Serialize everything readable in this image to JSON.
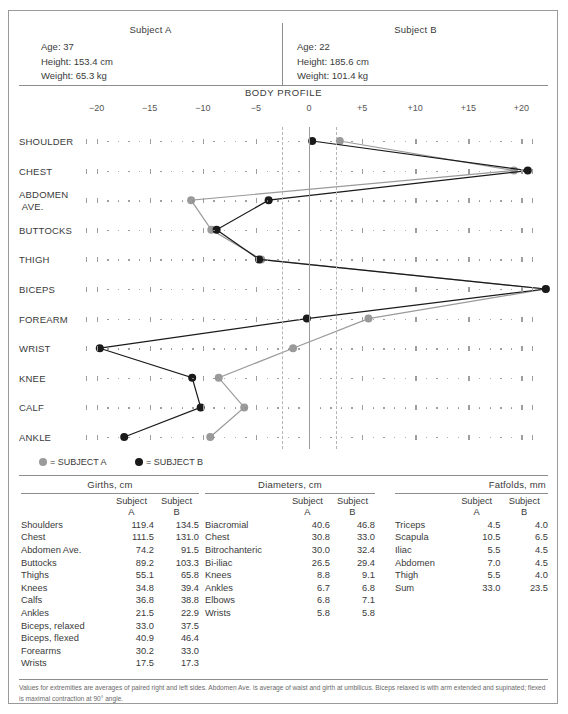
{
  "subjects": {
    "a": {
      "title": "Subject A",
      "age": "Age:  37",
      "height": "Height:  153.4 cm",
      "weight": "Weight:  65.3 kg"
    },
    "b": {
      "title": "Subject B",
      "age": "Age:  22",
      "height": "Height:  185.6 cm",
      "weight": "Weight:  101.4 kg"
    }
  },
  "chart_title": "BODY  PROFILE",
  "legend": {
    "a": "= SUBJECT A",
    "b": "= SUBJECT B",
    "color_a": "#9a9a9a",
    "color_b": "#1a1a1a"
  },
  "chart_data": {
    "type": "line",
    "title": "BODY PROFILE",
    "xlabel": "",
    "ylabel": "",
    "xlim": [
      -20,
      20
    ],
    "grid": true,
    "legend_position": "below",
    "orientation": "horizontal",
    "xticks": [
      "−20",
      "−15",
      "−10",
      "−5",
      "0",
      "+5",
      "+10",
      "+15",
      "+20"
    ],
    "xtick_values": [
      -20,
      -15,
      -10,
      -5,
      0,
      5,
      10,
      15,
      20
    ],
    "reference_lines": [
      {
        "value": 0,
        "style": "solid"
      },
      {
        "value": -2.5,
        "style": "dashed"
      },
      {
        "value": 2.5,
        "style": "dashed"
      }
    ],
    "categories": [
      "SHOULDER",
      "CHEST",
      "ABDOMEN AVE.",
      "BUTTOCKS",
      "THIGH",
      "BICEPS",
      "FOREARM",
      "WRIST",
      "KNEE",
      "CALF",
      "ANKLE"
    ],
    "series": [
      {
        "name": "SUBJECT A",
        "color": "#9a9a9a",
        "values": [
          2.9,
          19.3,
          -11.1,
          -9.2,
          -4.5,
          22.3,
          5.6,
          -1.5,
          -8.5,
          -6.1,
          -9.3
        ]
      },
      {
        "name": "SUBJECT B",
        "color": "#1a1a1a",
        "values": [
          0.3,
          20.6,
          -3.8,
          -8.7,
          -4.7,
          22.3,
          -0.2,
          -19.7,
          -11.0,
          -10.2,
          -17.4
        ]
      }
    ]
  },
  "tables": {
    "girths": {
      "caption": "Girths, cm",
      "col_a": "Subject\nA",
      "col_a_l1": "Subject",
      "col_a_l2": "A",
      "col_b_l1": "Subject",
      "col_b_l2": "B",
      "rows": [
        {
          "label": "Shoulders",
          "a": "119.4",
          "b": "134.5"
        },
        {
          "label": "Chest",
          "a": "111.5",
          "b": "131.0"
        },
        {
          "label": "Abdomen Ave.",
          "a": "74.2",
          "b": "91.5"
        },
        {
          "label": "Buttocks",
          "a": "89.2",
          "b": "103.3"
        },
        {
          "label": "Thighs",
          "a": "55.1",
          "b": "65.8"
        },
        {
          "label": "Knees",
          "a": "34.8",
          "b": "39.4"
        },
        {
          "label": "Calfs",
          "a": "36.8",
          "b": "38.8"
        },
        {
          "label": "Ankles",
          "a": "21.5",
          "b": "22.9"
        },
        {
          "label": "Biceps, relaxed",
          "a": "33.0",
          "b": "37.5"
        },
        {
          "label": "Biceps, flexed",
          "a": "40.9",
          "b": "46.4"
        },
        {
          "label": "Forearms",
          "a": "30.2",
          "b": "33.0"
        },
        {
          "label": "Wrists",
          "a": "17.5",
          "b": "17.3"
        }
      ]
    },
    "diameters": {
      "caption": "Diameters, cm",
      "col_a_l1": "Subject",
      "col_a_l2": "A",
      "col_b_l1": "Subject",
      "col_b_l2": "B",
      "rows": [
        {
          "label": "Biacromial",
          "a": "40.6",
          "b": "46.8"
        },
        {
          "label": "Chest",
          "a": "30.8",
          "b": "33.0"
        },
        {
          "label": "Bitrochanteric",
          "a": "30.0",
          "b": "32.4"
        },
        {
          "label": "Bi-iliac",
          "a": "26.5",
          "b": "29.4"
        },
        {
          "label": "Knees",
          "a": "8.8",
          "b": "9.1"
        },
        {
          "label": "Ankles",
          "a": "6.7",
          "b": "6.8"
        },
        {
          "label": "Elbows",
          "a": "6.8",
          "b": "7.1"
        },
        {
          "label": "Wrists",
          "a": "5.8",
          "b": "5.8"
        }
      ]
    },
    "fatfolds": {
      "caption": "Fatfolds, mm",
      "col_a_l1": "Subject",
      "col_a_l2": "A",
      "col_b_l1": "Subject",
      "col_b_l2": "B",
      "rows": [
        {
          "label": "Triceps",
          "a": "4.5",
          "b": "4.0"
        },
        {
          "label": "Scapula",
          "a": "10.5",
          "b": "6.5"
        },
        {
          "label": "Iliac",
          "a": "5.5",
          "b": "4.5"
        },
        {
          "label": "Abdomen",
          "a": "7.0",
          "b": "4.5"
        },
        {
          "label": "Thigh",
          "a": "5.5",
          "b": "4.0"
        },
        {
          "label": "Sum",
          "a": "33.0",
          "b": "23.5"
        }
      ]
    }
  },
  "footnote": "Values for extremities are averages of paired right and left sides. Abdomen Ave. is average of waist and girth at umbilicus. Biceps relaxed is with arm extended and supinated; flexed is maximal contraction at 90° angle."
}
